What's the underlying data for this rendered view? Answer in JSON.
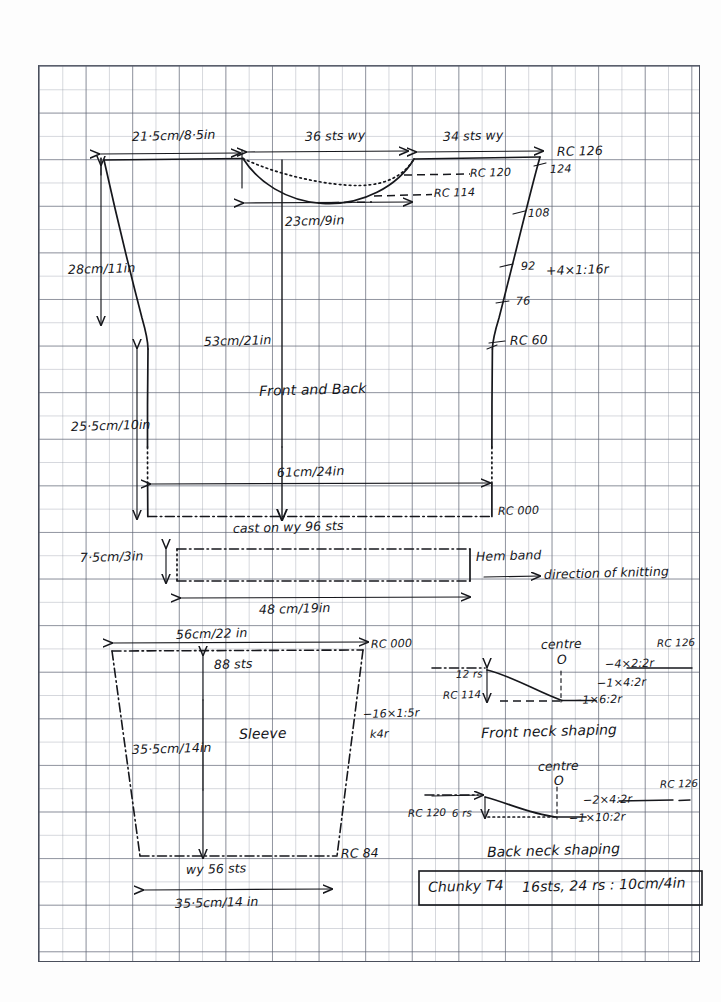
{
  "document": {
    "title": "Chunky T4 knitting pattern schematic",
    "paper": "graph paper"
  },
  "body_panel": {
    "name": "Front and Back",
    "caption": "Front and Back",
    "shoulder_width": "21·5cm/8·5in",
    "neck_sts_front": "36 sts wy",
    "shoulder_sts": "34 sts wy",
    "neck_width": "23cm/9in",
    "armhole_depth": "28cm/11in",
    "side_length": "25·5cm/10in",
    "total_length": "53cm/21in",
    "hem_width": "61cm/24in",
    "cast_on": "cast on wy  96 sts",
    "rc_top": "RC 126",
    "rc_back_neck": "RC 120",
    "rc_front_neck": "RC 114",
    "rc_bottom": "RC 000",
    "sts_124": "124",
    "sts_108": "108",
    "sts_92": "92",
    "inc_note": "+4×1:16r",
    "sts_76": "76",
    "rc_60": "RC 60"
  },
  "hem_band": {
    "label": "Hem band",
    "height": "7·5cm/3in",
    "width": "48 cm/19in",
    "direction": "direction of knitting"
  },
  "sleeve": {
    "caption": "Sleeve",
    "top_width": "56cm/22 in",
    "top_sts": "88 sts",
    "length": "35·5cm/14in",
    "cuff_sts": "wy  56 sts",
    "cuff_width": "35·5cm/14 in",
    "rc_top": "RC 000",
    "rc_cuff": "RC 84",
    "shaping": "−16×1:5r",
    "shaping2": "k4r"
  },
  "front_neck": {
    "caption": "Front neck shaping",
    "centre": "centre",
    "centre_mark": "O",
    "rows": "12 rs",
    "rc_start": "RC 114",
    "rc_end": "RC 126",
    "dec1": "−4×2:2r",
    "dec2": "−1×4:2r",
    "dec3": "−1×6:2r"
  },
  "back_neck": {
    "caption": "Back neck shaping",
    "centre": "centre",
    "centre_mark": "O",
    "rc_start": "RC 120",
    "rows": "6 rs",
    "rc_end": "RC 126",
    "dec1": "−2×4:2r",
    "dec2": "−1×10:2r"
  },
  "tension_box": {
    "yarn": "Chunky T4",
    "gauge": "16sts, 24 rs : 10cm/4in"
  },
  "colors": {
    "ink": "#16171c",
    "grid_major": "#5a5f6e",
    "grid_minor": "#969ba8",
    "paper": "#fdfdfd"
  }
}
